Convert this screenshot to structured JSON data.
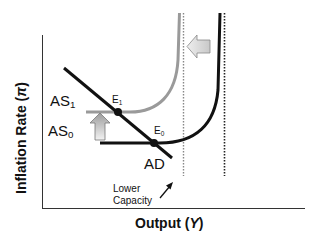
{
  "diagram": {
    "axes": {
      "x_label": "Output",
      "x_symbol": "Y",
      "y_label": "Inflation Rate",
      "y_symbol": "π"
    },
    "curves": {
      "ad": {
        "label": "AD",
        "color": "#111111"
      },
      "as0": {
        "label": "AS",
        "sub": "0",
        "color": "#111111"
      },
      "as1": {
        "label": "AS",
        "sub": "1",
        "color": "#9a9a9a"
      }
    },
    "points": {
      "e0": {
        "label": "E",
        "sub": "0"
      },
      "e1": {
        "label": "E",
        "sub": "1"
      }
    },
    "annotation": {
      "line1": "Lower",
      "line2": "Capacity"
    },
    "arrows": {
      "up_shift": "AS shifts up",
      "left_shift": "capacity shifts left"
    }
  }
}
